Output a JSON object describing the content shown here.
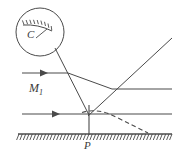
{
  "figure": {
    "type": "optics-ray-diagram",
    "background_color": "#ffffff",
    "stroke_color": "#4a4a4a",
    "labels": {
      "mirror_detail": "C",
      "incident_ray": "M",
      "incident_ray_sub": "1",
      "ground_point": "P"
    },
    "elements": {
      "detail_circle": {
        "name": "magnified-mirror-detail",
        "center_x": 40,
        "center_y": 32,
        "radius": 24
      },
      "mirror_in_circle": {
        "name": "hatched-mirror-surface",
        "hatch_count": 9
      },
      "upper_incident_ray": {
        "name": "upper-horizontal-ray",
        "x1": 22,
        "y1": 73,
        "x2": 68,
        "y2": 73,
        "arrow_at": 44
      },
      "lower_incident_ray": {
        "name": "lower-horizontal-ray",
        "x1": 22,
        "y1": 114,
        "x2": 89,
        "y2": 114,
        "arrow_at": 56
      },
      "upper_right_horizontal": {
        "name": "upper-right-horizontal-ray",
        "x1": 112,
        "y1": 89,
        "x2": 172,
        "y2": 89
      },
      "lower_right_horizontal": {
        "name": "lower-right-horizontal-ray",
        "x1": 89,
        "y1": 114,
        "x2": 172,
        "y2": 114
      },
      "ray_from_circle": {
        "name": "ray-from-detail-circle",
        "x1": 55,
        "y1": 48,
        "x2": 89,
        "y2": 114
      },
      "converging_ray_upper": {
        "name": "converging-ray-upper",
        "x1": 68,
        "y1": 73,
        "x2": 112,
        "y2": 89
      },
      "reflected_ray": {
        "name": "reflected-ray-upward",
        "x1": 88,
        "y1": 115,
        "x2": 172,
        "y2": 38
      },
      "vertical_normal": {
        "name": "vertical-normal-at-P",
        "x1": 89,
        "y1": 106,
        "x2": 89,
        "y2": 135
      },
      "dashed_curve": {
        "name": "dashed-wavefront-curve",
        "start_x": 82,
        "start_y": 112,
        "end_x": 148,
        "end_y": 133
      },
      "ground": {
        "name": "hatched-ground-surface",
        "x1": 18,
        "y1": 134,
        "x2": 172,
        "y2": 134,
        "hatch_count": 46
      }
    }
  }
}
